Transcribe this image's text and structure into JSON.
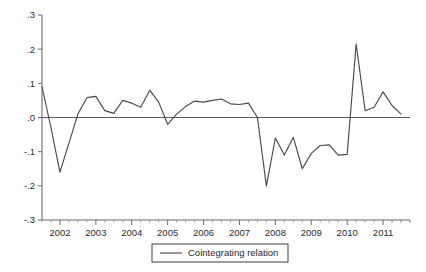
{
  "chart_data": {
    "type": "line",
    "title": "",
    "subtitle": "",
    "xlabel": "",
    "ylabel": "",
    "grid": false,
    "legend_position": "bottom-center",
    "ylim": [
      -0.3,
      0.3
    ],
    "xlim": [
      2001.5,
      2011.75
    ],
    "ytick_labels": [
      ".3",
      ".2",
      ".1",
      ".0",
      "-.1",
      "-.2",
      "-.3"
    ],
    "ytick_values": [
      0.3,
      0.2,
      0.1,
      0.0,
      -0.1,
      -0.2,
      -0.3
    ],
    "xtick_labels": [
      "2002",
      "2003",
      "2004",
      "2005",
      "2006",
      "2007",
      "2008",
      "2009",
      "2010",
      "2011"
    ],
    "xtick_values": [
      2002,
      2003,
      2004,
      2005,
      2006,
      2007,
      2008,
      2009,
      2010,
      2011
    ],
    "xtick_minor_per_major": 4,
    "zero_reference_line": 0.0,
    "series": [
      {
        "name": "Cointegrating relation",
        "color": "#4a4a4a",
        "x": [
          2001.5,
          2001.75,
          2002.0,
          2002.25,
          2002.5,
          2002.75,
          2003.0,
          2003.25,
          2003.5,
          2003.75,
          2004.0,
          2004.25,
          2004.5,
          2004.75,
          2005.0,
          2005.25,
          2005.5,
          2005.75,
          2006.0,
          2006.25,
          2006.5,
          2006.75,
          2007.0,
          2007.25,
          2007.5,
          2007.75,
          2008.0,
          2008.25,
          2008.5,
          2008.75,
          2009.0,
          2009.25,
          2009.5,
          2009.75,
          2010.0,
          2010.25,
          2010.5,
          2010.75,
          2011.0,
          2011.25,
          2011.5
        ],
        "values": [
          0.09,
          -0.03,
          -0.16,
          -0.075,
          0.01,
          0.058,
          0.062,
          0.02,
          0.012,
          0.05,
          0.042,
          0.03,
          0.08,
          0.045,
          -0.02,
          0.01,
          0.032,
          0.048,
          0.045,
          0.05,
          0.054,
          0.04,
          0.038,
          0.042,
          0.0,
          -0.2,
          -0.06,
          -0.11,
          -0.058,
          -0.15,
          -0.105,
          -0.082,
          -0.08,
          -0.11,
          -0.108,
          0.215,
          0.02,
          0.03,
          0.075,
          0.035,
          0.01
        ]
      }
    ],
    "legend": [
      {
        "label": "Cointegrating relation",
        "color": "#4a4a4a",
        "marker": "line"
      }
    ]
  },
  "colors": {
    "background": "#ffffff",
    "axis": "#6b6b6b",
    "series": "#4a4a4a",
    "text": "#2b2b2b",
    "legend_border": "#3d3d3d"
  }
}
